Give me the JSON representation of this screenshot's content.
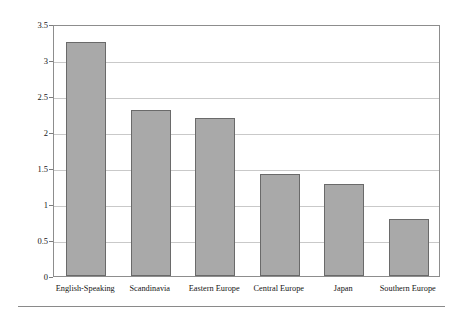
{
  "chart_data": {
    "type": "bar",
    "title": "",
    "subtitle": "",
    "xlabel": "",
    "ylabel": "Divorce Per 1000 Population",
    "categories": [
      "English-Speaking",
      "Scandinavia",
      "Eastern Europe",
      "Central Europe",
      "Japan",
      "Southern Europe"
    ],
    "values": [
      3.25,
      2.3,
      2.2,
      1.42,
      1.28,
      0.79
    ],
    "ylim": [
      0,
      3.5
    ],
    "ytick_labels": [
      "3.5",
      "3",
      "2.5",
      "2",
      "1.5",
      "1",
      "0.5",
      "0"
    ],
    "ytick_values": [
      3.5,
      3,
      2.5,
      2,
      1.5,
      1,
      0.5,
      0
    ],
    "grid": true,
    "legend": false,
    "legend_position": "none",
    "bar_color": "#a9a9a9",
    "bar_border_color": "#6a6a6a",
    "grid_color": "#c9c9c9",
    "frame_color": "#8d8d8d",
    "text_color": "#151515"
  }
}
